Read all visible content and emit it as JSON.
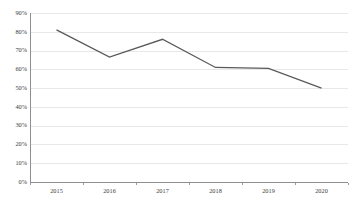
{
  "chart_data": {
    "type": "line",
    "title": "",
    "subtitle": "",
    "xlabel": "",
    "ylabel": "",
    "categories": [
      "2015",
      "2016",
      "2017",
      "2018",
      "2019",
      "2020"
    ],
    "x": [
      2015,
      2016,
      2017,
      2018,
      2019,
      2020
    ],
    "series": [
      {
        "name": "",
        "values": [
          81,
          66.5,
          76,
          61,
          60.5,
          50
        ],
        "color": "#595959"
      }
    ],
    "values": [
      81,
      66.5,
      76,
      61,
      60.5,
      50
    ],
    "value_suffix": "%",
    "ylim": [
      0,
      90
    ],
    "ytick_step": 10,
    "ytick_labels": [
      "0%",
      "10%",
      "20%",
      "30%",
      "40%",
      "50%",
      "60%",
      "70%",
      "80%",
      "90%"
    ],
    "ytick_values": [
      0,
      10,
      20,
      30,
      40,
      50,
      60,
      70,
      80,
      90
    ],
    "xtick_labels": [
      "2015",
      "2016",
      "2017",
      "2018",
      "2019",
      "2020"
    ],
    "grid": {
      "horizontal": true,
      "vertical": false,
      "color": "#e8e8e8"
    },
    "legend": {
      "visible": false,
      "position": "none",
      "entries": []
    },
    "markers": false,
    "line_width": 1.3,
    "axis_color": "#8f8f8f",
    "background": "#ffffff",
    "plot_left_px": 30,
    "plot_top_px": 13,
    "plot_width_px": 318,
    "plot_height_px": 169
  }
}
